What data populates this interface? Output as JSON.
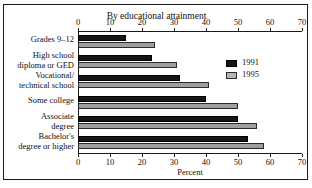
{
  "page": {
    "top_clipped_fragment": "",
    "top_clipped_fragment_right": ""
  },
  "chart_data": {
    "type": "bar",
    "orientation": "horizontal",
    "title": "By educational attainment",
    "xlabel": "Percent",
    "ylabel": "",
    "xlim": [
      0,
      70
    ],
    "xticks": [
      0,
      10,
      20,
      30,
      40,
      50,
      60,
      70
    ],
    "xtick_labels": [
      "0",
      "10",
      "20",
      "30",
      "40",
      "50",
      "60",
      "70"
    ],
    "grid": false,
    "axis_top": true,
    "axis_bottom": true,
    "legend_position": "right",
    "categories": [
      "Grades 9–12",
      "High school\ndiploma or GED",
      "Vocational/\ntechnical school",
      "Some college",
      "Associate\ndegree",
      "Bachelor's\ndegree or higher"
    ],
    "series": [
      {
        "name": "1991",
        "color": "#151515",
        "values": [
          15,
          23,
          32,
          40,
          50,
          53
        ]
      },
      {
        "name": "1995",
        "color": "#9e9e9e",
        "values": [
          24,
          31,
          41,
          50,
          56,
          58
        ]
      }
    ]
  }
}
